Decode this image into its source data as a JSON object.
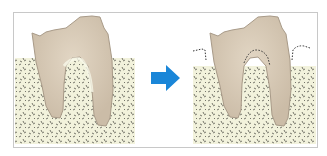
{
  "diagram": {
    "panels": [
      {
        "label": "before",
        "description": "Molar tooth with two roots fully embedded in healthy bone"
      },
      {
        "label": "after",
        "description": "Molar tooth with bone level receded; dotted line shows original bone level"
      }
    ],
    "arrow": {
      "direction": "right",
      "color": "#1a86d8"
    },
    "colors": {
      "tooth": "#d9cbb8",
      "tooth_outline": "#a89a88",
      "bone": "#f2f2dc",
      "bone_texture": "#555550",
      "frame": "#c8c8c8",
      "dotted_line": "#333333"
    }
  }
}
